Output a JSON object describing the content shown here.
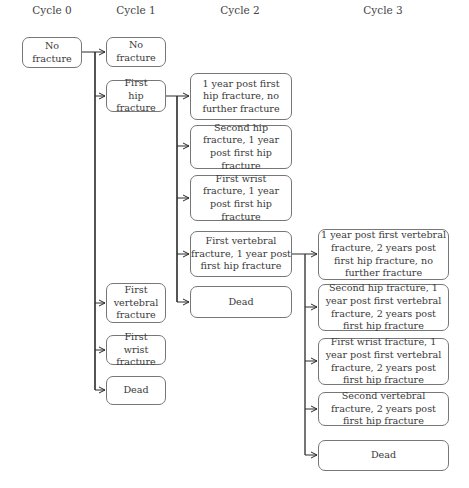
{
  "headers": [
    "Cycle 0",
    "Cycle 1",
    "Cycle 2",
    "Cycle 3"
  ],
  "cycle0": [
    {
      "label": "No fracture"
    }
  ],
  "cycle1": [
    {
      "label": "No fracture"
    },
    {
      "label": "First hip fracture"
    },
    {
      "label": "First vertebral fracture"
    },
    {
      "label": "First wrist fracture"
    },
    {
      "label": "Dead"
    }
  ],
  "cycle2": [
    {
      "label": "1 year post first hip fracture, no further fracture"
    },
    {
      "label": "Second hip fracture, 1 year post first hip fracture"
    },
    {
      "label": "First wrist fracture, 1 year post first hip fracture"
    },
    {
      "label": "First vertebral fracture, 1 year post first hip fracture"
    },
    {
      "label": "Dead"
    }
  ],
  "cycle3": [
    {
      "label": "1 year post first vertebral fracture, 2 years post first hip fracture, no further fracture"
    },
    {
      "label": "Second hip fracture, 1 year post first vertebral fracture, 2 years post first hip fracture"
    },
    {
      "label": "First wrist fracture, 1 year post first vertebral fracture, 2 years post first hip fracture"
    },
    {
      "label": "Second vertebral fracture, 2 years post first hip fracture"
    },
    {
      "label": "Dead"
    }
  ],
  "edges": [
    {
      "from": "cycle0.0",
      "to": [
        "cycle1.0",
        "cycle1.1",
        "cycle1.2",
        "cycle1.3",
        "cycle1.4"
      ]
    },
    {
      "from": "cycle1.1",
      "to": [
        "cycle2.0",
        "cycle2.1",
        "cycle2.2",
        "cycle2.3",
        "cycle2.4"
      ]
    },
    {
      "from": "cycle2.3",
      "to": [
        "cycle3.0",
        "cycle3.1",
        "cycle3.2",
        "cycle3.3",
        "cycle3.4"
      ]
    }
  ],
  "colors": {
    "line": "#2a2a2a",
    "box_border": "#777777",
    "text": "#3a3a3a"
  }
}
